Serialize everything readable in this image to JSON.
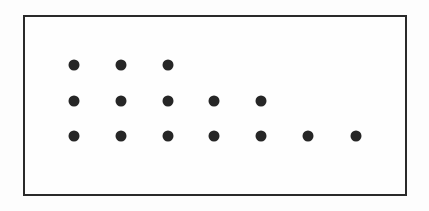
{
  "diagram": {
    "type": "dot-array",
    "frame": {
      "border_color": "#2a2a2a",
      "background": "#fefefe"
    },
    "dot_color": "#262626",
    "rows": [
      {
        "count": 3,
        "y": 65
      },
      {
        "count": 5,
        "y": 101
      },
      {
        "count": 7,
        "y": 136
      }
    ],
    "column_x": [
      74,
      121,
      168,
      214,
      261,
      308,
      356
    ],
    "total_dots": 15
  }
}
